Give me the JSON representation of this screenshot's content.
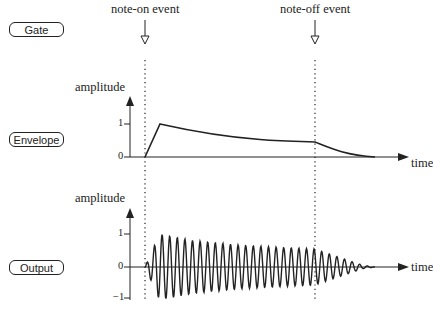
{
  "rows": {
    "gate": "Gate",
    "envelope": "Envelope",
    "output": "Output"
  },
  "events": {
    "note_on": "note-on event",
    "note_off": "note-off event"
  },
  "envelope_plot": {
    "ylabel": "amplitude",
    "xlabel": "time",
    "yticks": [
      "1",
      "0"
    ]
  },
  "output_plot": {
    "ylabel": "amplitude",
    "xlabel": "time",
    "yticks": [
      "1",
      "0",
      "−1"
    ]
  },
  "colors": {
    "ink": "#222222",
    "background": "#ffffff"
  },
  "chart_data": [
    {
      "type": "line",
      "title": "Envelope",
      "xlabel": "time",
      "ylabel": "amplitude",
      "ylim": [
        0,
        1.2
      ],
      "yticks": [
        0,
        1
      ],
      "annotations": [
        "note-on event",
        "note-off event"
      ],
      "description": "ADSR-style envelope: linear attack from 0 to 1 after note-on, slow decay toward ~0.55 until note-off, then release to 0",
      "x": [
        0.0,
        0.06,
        0.2,
        0.4,
        0.6,
        0.7,
        0.8,
        0.9,
        0.95
      ],
      "values": [
        0.0,
        1.0,
        0.8,
        0.66,
        0.58,
        0.55,
        0.3,
        0.05,
        0.0
      ]
    },
    {
      "type": "line",
      "title": "Output",
      "xlabel": "time",
      "ylabel": "amplitude",
      "ylim": [
        -1.2,
        1.2
      ],
      "yticks": [
        -1,
        0,
        1
      ],
      "description": "Oscillating waveform amplitude-modulated by the envelope: rises to ±1 quickly after note-on, slowly decays to ~±0.55 by note-off, then decays to 0",
      "envelope_x": [
        0.0,
        0.06,
        0.2,
        0.4,
        0.6,
        0.7,
        0.8,
        0.9,
        0.95
      ],
      "envelope_values": [
        0.0,
        1.0,
        0.8,
        0.66,
        0.58,
        0.55,
        0.3,
        0.05,
        0.0
      ]
    }
  ]
}
